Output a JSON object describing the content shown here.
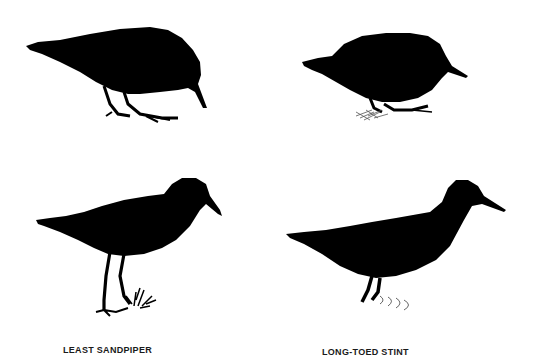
{
  "figure": {
    "background_color": "#ffffff",
    "silhouette_color": "#000000",
    "panels": [
      {
        "position": "top-left",
        "species": "Least Sandpiper",
        "pose": "feeding, head down, bill pointing to ground"
      },
      {
        "position": "top-right",
        "species": "Long-toed Stint",
        "pose": "crouched feeding, grass tuft at feet"
      },
      {
        "position": "bottom-left",
        "species": "Least Sandpiper",
        "pose": "standing upright, grass tuft at feet"
      },
      {
        "position": "bottom-right",
        "species": "Long-toed Stint",
        "pose": "standing, water ripples at feet"
      }
    ],
    "captions": {
      "left": "LEAST SANDPIPER",
      "right": "LONG-TOED STINT"
    }
  }
}
